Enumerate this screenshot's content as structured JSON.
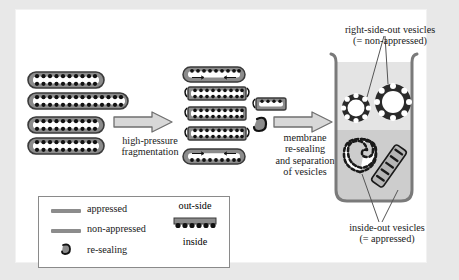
{
  "figure": {
    "background": "#e8e8e8",
    "panel_background": "#ffffff"
  },
  "colors": {
    "membrane_gray": "#8c8c8c",
    "membrane_dark": "#5a5a5a",
    "particle_black": "#111111",
    "lumen_white": "#ffffff",
    "arrow_fill": "#d8d8d8",
    "arrow_stroke": "#6f6f6f",
    "beaker_stroke": "#7a7a7a",
    "gradient_top": "#e2e2e2",
    "gradient_bottom": "#c9c9c9",
    "text": "#1a1a1a"
  },
  "stages": {
    "grana_stack": {
      "name": "appressed grana stack",
      "disc_count": 4
    },
    "fragmentation": {
      "arrow_label_line1": "high-pressure",
      "arrow_label_line2": "fragmentation",
      "fragment_count": 5
    },
    "resealing": {
      "arrow_label_line1": "membrane",
      "arrow_label_line2": "re-sealing",
      "arrow_label_line3": "and separation",
      "arrow_label_line4": "of vesicles"
    }
  },
  "beaker": {
    "top_label_line1": "right-side-out vesicles",
    "top_label_line2": "(= non-appressed)",
    "bottom_label_line1": "inside-out vesicles",
    "bottom_label_line2": "(= appressed)",
    "right_side_out_count": 2,
    "inside_out_count": 2
  },
  "legend": {
    "items": [
      {
        "label": "appressed",
        "icon": "gray-bar-icon"
      },
      {
        "label": "non-appressed",
        "icon": "gray-bar-icon"
      },
      {
        "label": "re-sealing",
        "icon": "hook-icon"
      }
    ],
    "membrane_key": {
      "outside_label": "out-side",
      "inside_label": "inside"
    }
  }
}
